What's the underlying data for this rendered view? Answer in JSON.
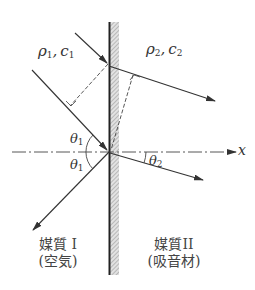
{
  "diagram": {
    "type": "acoustic refraction at boundary",
    "medium1": {
      "params_label": "ρ1, c1",
      "rho": "ρ",
      "rho_sub": "1",
      "c": "c",
      "c_sub": "1",
      "name_line1": "媒質 I",
      "name_line2": "(空気)"
    },
    "medium2": {
      "params_label": "ρ2, c2",
      "rho": "ρ",
      "rho_sub": "2",
      "c": "c",
      "c_sub": "2",
      "name_line1": "媒質II",
      "name_line2": "(吸音材)"
    },
    "angles": {
      "incident": {
        "symbol": "θ",
        "sub": "1"
      },
      "reflected": {
        "symbol": "θ",
        "sub": "1"
      },
      "refracted": {
        "symbol": "θ",
        "sub": "2"
      }
    },
    "axis_label": "x",
    "colors": {
      "line": "#333333",
      "wall_fill": "#c8c8c8",
      "wall_edge": "#222222",
      "background": "#ffffff"
    }
  }
}
